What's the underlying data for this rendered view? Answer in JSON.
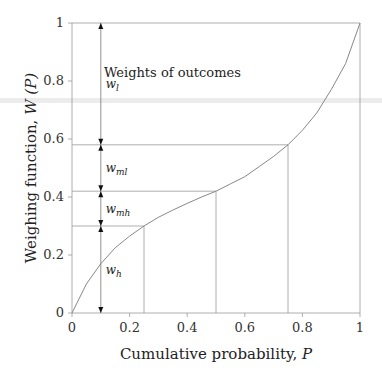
{
  "chart_data": {
    "type": "line",
    "title": "",
    "xlabel": "Cumulative probability, P",
    "ylabel": "Weighing function, W(P)",
    "xlim": [
      0,
      1
    ],
    "ylim": [
      0,
      1
    ],
    "grid": false,
    "x_ticks": [
      "0",
      "0.2",
      "0.4",
      "0.6",
      "0.8",
      "1"
    ],
    "y_ticks": [
      "0",
      "0.2",
      "0.4",
      "0.6",
      "0.8",
      "1"
    ],
    "series": [
      {
        "name": "W(P)",
        "x": [
          0,
          0.05,
          0.1,
          0.15,
          0.2,
          0.25,
          0.3,
          0.35,
          0.4,
          0.45,
          0.5,
          0.55,
          0.6,
          0.65,
          0.7,
          0.75,
          0.8,
          0.85,
          0.9,
          0.95,
          1
        ],
        "values": [
          0,
          0.1,
          0.17,
          0.225,
          0.265,
          0.3,
          0.33,
          0.355,
          0.378,
          0.4,
          0.42,
          0.445,
          0.47,
          0.505,
          0.54,
          0.58,
          0.63,
          0.69,
          0.77,
          0.86,
          1
        ]
      }
    ],
    "reference_points": [
      {
        "P": 0.25,
        "W": 0.3
      },
      {
        "P": 0.5,
        "W": 0.42
      },
      {
        "P": 0.75,
        "W": 0.58
      },
      {
        "P": 1.0,
        "W": 1.0
      }
    ],
    "annotations": {
      "header": "Weights of outcomes",
      "arrow_x": 0.1,
      "weights": [
        {
          "label": "w",
          "sub": "l",
          "from": 0.58,
          "to": 1.0
        },
        {
          "label": "w",
          "sub": "ml",
          "from": 0.42,
          "to": 0.58
        },
        {
          "label": "w",
          "sub": "mh",
          "from": 0.3,
          "to": 0.42
        },
        {
          "label": "w",
          "sub": "h",
          "from": 0.0,
          "to": 0.3
        }
      ]
    }
  },
  "labels": {
    "xlabel_main": "Cumulative probability, ",
    "xlabel_var": "P",
    "ylabel_main": "Weighing function, ",
    "ylabel_var": "W (P)",
    "header": "Weights of outcomes"
  }
}
